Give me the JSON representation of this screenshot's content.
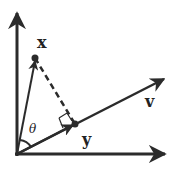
{
  "diagram": {
    "colors": {
      "stroke": "#2b2b2b",
      "background": "#ffffff"
    },
    "labels": {
      "x": "x",
      "v": "v",
      "y": "y",
      "theta": "θ"
    },
    "points": {
      "origin": [
        17,
        154
      ],
      "x_point": [
        35,
        58
      ],
      "projection_point": [
        75,
        124
      ],
      "v_tip": [
        165,
        78
      ],
      "x_axis_tip": [
        166,
        154
      ],
      "y_axis_tip": [
        17,
        12
      ]
    }
  }
}
